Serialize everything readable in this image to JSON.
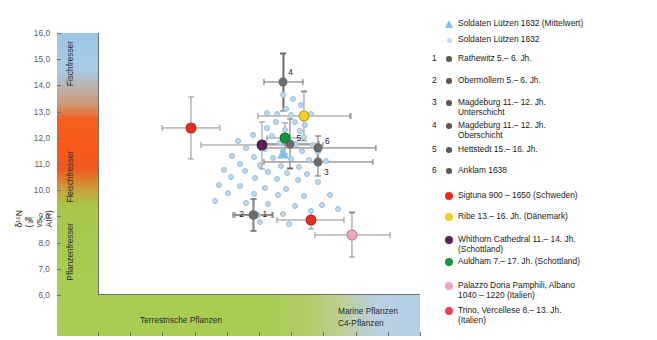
{
  "chart_data": {
    "type": "scatter",
    "title": "",
    "xlabel": "δ13C (‰ vs. PDB)",
    "ylabel": "δ15N (‰ vs. AIR)",
    "xlim": [
      -22.5,
      -17.5
    ],
    "ylim": [
      6.0,
      16.0
    ],
    "xticks": [
      "-22,5",
      "-22,0",
      "-21,5",
      "-21,0",
      "-20,5",
      "-20,0",
      "-19,5",
      "-19,0",
      "-18,5",
      "-18,0",
      "-17,5"
    ],
    "xtick_values": [
      -22.5,
      -22.0,
      -21.5,
      -21.0,
      -20.5,
      -20.0,
      -19.5,
      -19.0,
      -18.5,
      -18.0,
      -17.5
    ],
    "yticks": [
      "16,0",
      "15,0",
      "14,0",
      "13,0",
      "12,0",
      "11,0",
      "10,0",
      "9,0",
      "8,0",
      "7,0",
      "6,0"
    ],
    "ytick_values": [
      16.0,
      15.0,
      14.0,
      13.0,
      12.0,
      11.0,
      10.0,
      9.0,
      8.0,
      7.0,
      6.0
    ],
    "grid": false,
    "legend_position": "right",
    "background_bands": {
      "vertical": [
        {
          "label": "Fischfresser",
          "color": "#9cc6e6",
          "range": [
            12.6,
            16.0
          ]
        },
        {
          "label": "Fleischfresser",
          "color": "#f4601e",
          "range": [
            8.6,
            12.6
          ]
        },
        {
          "label": "Pflanzenfresser",
          "color": "#a9cd52",
          "range": [
            6.0,
            8.6
          ]
        }
      ],
      "horizontal": [
        {
          "label": "Terrestrische Pflanzen",
          "color": "#a9cd52"
        },
        {
          "label": "Marine Pflanzen",
          "color": "#b4cfe6"
        },
        {
          "label": "C4-Pflanzen",
          "color": "#b4cfe6"
        }
      ]
    },
    "series": [
      {
        "name": "Soldaten Lützen 1632 (Mittelwert)",
        "marker": "triangle",
        "color": "#7ec0e8",
        "points": [
          {
            "x": -19.62,
            "y": 11.38
          }
        ]
      },
      {
        "name": "Soldaten Lützen 1632",
        "marker": "small-circle",
        "color": "#bcd9ef",
        "points": [
          {
            "x": -19.63,
            "y": 13.63
          },
          {
            "x": -19.47,
            "y": 13.5
          },
          {
            "x": -19.35,
            "y": 13.27
          },
          {
            "x": -19.58,
            "y": 13.1
          },
          {
            "x": -19.88,
            "y": 12.96
          },
          {
            "x": -19.72,
            "y": 12.92
          },
          {
            "x": -19.5,
            "y": 12.86
          },
          {
            "x": -19.2,
            "y": 12.9
          },
          {
            "x": -19.74,
            "y": 12.6
          },
          {
            "x": -19.44,
            "y": 12.62
          },
          {
            "x": -19.28,
            "y": 12.5
          },
          {
            "x": -19.88,
            "y": 12.36
          },
          {
            "x": -19.6,
            "y": 12.3
          },
          {
            "x": -19.36,
            "y": 12.26
          },
          {
            "x": -20.1,
            "y": 12.12
          },
          {
            "x": -19.8,
            "y": 12.05
          },
          {
            "x": -19.55,
            "y": 12.0
          },
          {
            "x": -19.3,
            "y": 12.03
          },
          {
            "x": -20.32,
            "y": 11.88
          },
          {
            "x": -19.96,
            "y": 11.83
          },
          {
            "x": -19.68,
            "y": 11.8
          },
          {
            "x": -19.42,
            "y": 11.76
          },
          {
            "x": -19.16,
            "y": 11.72
          },
          {
            "x": -20.2,
            "y": 11.6
          },
          {
            "x": -19.9,
            "y": 11.56
          },
          {
            "x": -19.62,
            "y": 11.5
          },
          {
            "x": -19.34,
            "y": 11.48
          },
          {
            "x": -19.08,
            "y": 11.44
          },
          {
            "x": -20.42,
            "y": 11.3
          },
          {
            "x": -20.08,
            "y": 11.28
          },
          {
            "x": -19.78,
            "y": 11.22
          },
          {
            "x": -19.5,
            "y": 11.2
          },
          {
            "x": -19.22,
            "y": 11.16
          },
          {
            "x": -18.96,
            "y": 11.12
          },
          {
            "x": -20.3,
            "y": 11.0
          },
          {
            "x": -19.98,
            "y": 10.96
          },
          {
            "x": -19.66,
            "y": 10.94
          },
          {
            "x": -19.38,
            "y": 10.9
          },
          {
            "x": -20.54,
            "y": 10.78
          },
          {
            "x": -20.22,
            "y": 10.72
          },
          {
            "x": -19.86,
            "y": 10.7
          },
          {
            "x": -19.56,
            "y": 10.66
          },
          {
            "x": -19.26,
            "y": 10.62
          },
          {
            "x": -20.44,
            "y": 10.5
          },
          {
            "x": -20.06,
            "y": 10.46
          },
          {
            "x": -19.72,
            "y": 10.42
          },
          {
            "x": -19.4,
            "y": 10.38
          },
          {
            "x": -20.62,
            "y": 10.2
          },
          {
            "x": -20.3,
            "y": 10.16
          },
          {
            "x": -19.9,
            "y": 10.1
          },
          {
            "x": -19.58,
            "y": 10.06
          },
          {
            "x": -19.08,
            "y": 10.3
          },
          {
            "x": -20.48,
            "y": 9.9
          },
          {
            "x": -20.08,
            "y": 9.86
          },
          {
            "x": -19.7,
            "y": 9.8
          },
          {
            "x": -19.3,
            "y": 9.76
          },
          {
            "x": -18.9,
            "y": 9.82
          },
          {
            "x": -20.68,
            "y": 9.6
          },
          {
            "x": -20.2,
            "y": 9.5
          },
          {
            "x": -19.86,
            "y": 9.46
          },
          {
            "x": -19.44,
            "y": 9.4
          },
          {
            "x": -19.02,
            "y": 9.44
          },
          {
            "x": -19.62,
            "y": 9.1
          },
          {
            "x": -19.2,
            "y": 9.2
          },
          {
            "x": -20.02,
            "y": 9.05
          },
          {
            "x": -18.78,
            "y": 9.3
          },
          {
            "x": -19.98,
            "y": 8.8
          },
          {
            "x": -19.54,
            "y": 8.7
          }
        ]
      },
      {
        "name": "Rathewitz 5.-6. Jh.",
        "index": "1",
        "marker": "gray-circle",
        "color": "#6b6b6b",
        "points": [
          {
            "x": -20.08,
            "y": 9.05,
            "xerr": 0.3,
            "yerr": 0.62
          }
        ]
      },
      {
        "name": "Obermöllern 5.-6. Jh.",
        "index": "2",
        "marker": "gray-circle",
        "color": "#6b6b6b",
        "points": [
          {
            "x": -20.1,
            "y": 9.05,
            "xerr": 0.3,
            "yerr": 0.62
          }
        ]
      },
      {
        "name": "Magdeburg 11.-12. Jh. Unterschicht",
        "index": "3",
        "marker": "gray-circle",
        "color": "#6b6b6b",
        "points": [
          {
            "x": -19.08,
            "y": 11.08,
            "xerr": 0.85,
            "yerr": 0.55
          }
        ]
      },
      {
        "name": "Magdeburg 11.-12. Jh. Oberschicht",
        "index": "4",
        "marker": "gray-circle",
        "color": "#6b6b6b",
        "points": [
          {
            "x": -19.62,
            "y": 14.12,
            "xerr": 0.3,
            "yerr": 1.1
          }
        ]
      },
      {
        "name": "Hettstedt 15.-16. Jh.",
        "index": "5",
        "marker": "gray-circle",
        "color": "#6b6b6b",
        "points": [
          {
            "x": -19.52,
            "y": 11.78,
            "xerr": 0.45,
            "yerr": 0.95
          }
        ]
      },
      {
        "name": "Anklam 1638",
        "index": "6",
        "marker": "gray-circle",
        "color": "#6b6b6b",
        "points": [
          {
            "x": -19.08,
            "y": 11.62,
            "xerr": 0.9,
            "yerr": 0.45
          }
        ]
      },
      {
        "name": "Sigtuna 900 - 1650 (Schweden)",
        "marker": "circle",
        "color": "#ee2b20",
        "points": [
          {
            "x": -21.05,
            "y": 12.38,
            "xerr": 0.45,
            "yerr": 1.18
          },
          {
            "x": -19.2,
            "y": 8.88,
            "xerr": 0.52,
            "yerr": 0.35
          }
        ]
      },
      {
        "name": "Ribe 13.-16. Jh. (Dänemark)",
        "marker": "circle",
        "color": "#f2d021",
        "points": [
          {
            "x": -19.3,
            "y": 12.82,
            "xerr": 0.72,
            "yerr": 0.95
          }
        ]
      },
      {
        "name": "Whithorn Cathedral 11.-14. Jh. (Schottland)",
        "marker": "circle",
        "color": "#5a2258",
        "points": [
          {
            "x": -19.95,
            "y": 11.72,
            "xerr": 0.95,
            "yerr": 0.9
          }
        ]
      },
      {
        "name": "Auldham 7.-17. Jh. (Schottland)",
        "marker": "circle",
        "color": "#15963c",
        "points": [
          {
            "x": -19.6,
            "y": 11.98,
            "xerr": 0.28,
            "yerr": 0.6
          }
        ]
      },
      {
        "name": "Palazzo Doria Pamphili, Albano 1040 - 1220 (Italien)",
        "marker": "circle",
        "color": "#f3a5bd",
        "points": [
          {
            "x": -18.55,
            "y": 8.3,
            "xerr": 0.58,
            "yerr": 0.85
          }
        ]
      },
      {
        "name": "Trino, Vercellese 8.-13. Jh. (Italien)",
        "marker": "circle",
        "color": "#ef4058",
        "points": []
      }
    ]
  },
  "axis": {
    "x_title": "δ¹³C (‰ vs. PDB)",
    "y_title": "δ¹⁵N (‰ vs. AIR)"
  },
  "bands": {
    "fischfresser": "Fischfresser",
    "fleischfresser": "Fleischfresser",
    "pflanzenfresser": "Pflanzenfresser",
    "terrestrische": "Terrestrische Pflanzen",
    "marine": "Marine Pflanzen",
    "c4": "C4-Pflanzen"
  },
  "legend": {
    "items": [
      {
        "index": "",
        "label": "Soldaten Lützen 1632 (Mittelwert)",
        "marker": "triangle",
        "color": "#7ec0e8"
      },
      {
        "index": "",
        "label": "Soldaten Lützen 1632",
        "marker": "small",
        "color": "#bcd9ef"
      },
      {
        "index": "1",
        "label": "Rathewitz 5.– 6. Jh.",
        "marker": "gray",
        "color": "#5a5a5a"
      },
      {
        "index": "2",
        "label": "Obermöllern 5.– 6. Jh.",
        "marker": "gray",
        "color": "#5a5a5a"
      },
      {
        "index": "3",
        "label": "Magdeburg 11.– 12. Jh.\nUnterschicht",
        "marker": "gray",
        "color": "#5a5a5a"
      },
      {
        "index": "4",
        "label": "Magdeburg 11.– 12. Jh.\nOberschicht",
        "marker": "gray",
        "color": "#5a5a5a"
      },
      {
        "index": "5",
        "label": "Hettstedt 15.– 16. Jh.",
        "marker": "gray",
        "color": "#5a5a5a"
      },
      {
        "index": "6",
        "label": "Anklam 1638",
        "marker": "gray",
        "color": "#5a5a5a"
      },
      {
        "index": "",
        "label": "Sigtuna 900 – 1650 (Schweden)",
        "marker": "dot",
        "color": "#ee2b20"
      },
      {
        "index": "",
        "label": "Ribe 13.– 16. Jh. (Dänemark)",
        "marker": "dot",
        "color": "#f2d021"
      },
      {
        "index": "",
        "label": "Whithorn Cathedral 11.– 14. Jh.\n(Schottland)",
        "marker": "dot",
        "color": "#5a2258"
      },
      {
        "index": "",
        "label": "Auldham 7.– 17. Jh. (Schottland)",
        "marker": "dot",
        "color": "#15963c"
      },
      {
        "index": "",
        "label": "Palazzo Doria Pamphili, Albano\n1040 – 1220 (Italien)",
        "marker": "dot",
        "color": "#f3a5bd"
      },
      {
        "index": "",
        "label": "Trino, Vercellese 8.– 13. Jh.\n(Italien)",
        "marker": "dot",
        "color": "#ef4058"
      }
    ],
    "row_tops": [
      10,
      26,
      45,
      67,
      89,
      112,
      136,
      157,
      182,
      203,
      226,
      248,
      272,
      297
    ]
  }
}
